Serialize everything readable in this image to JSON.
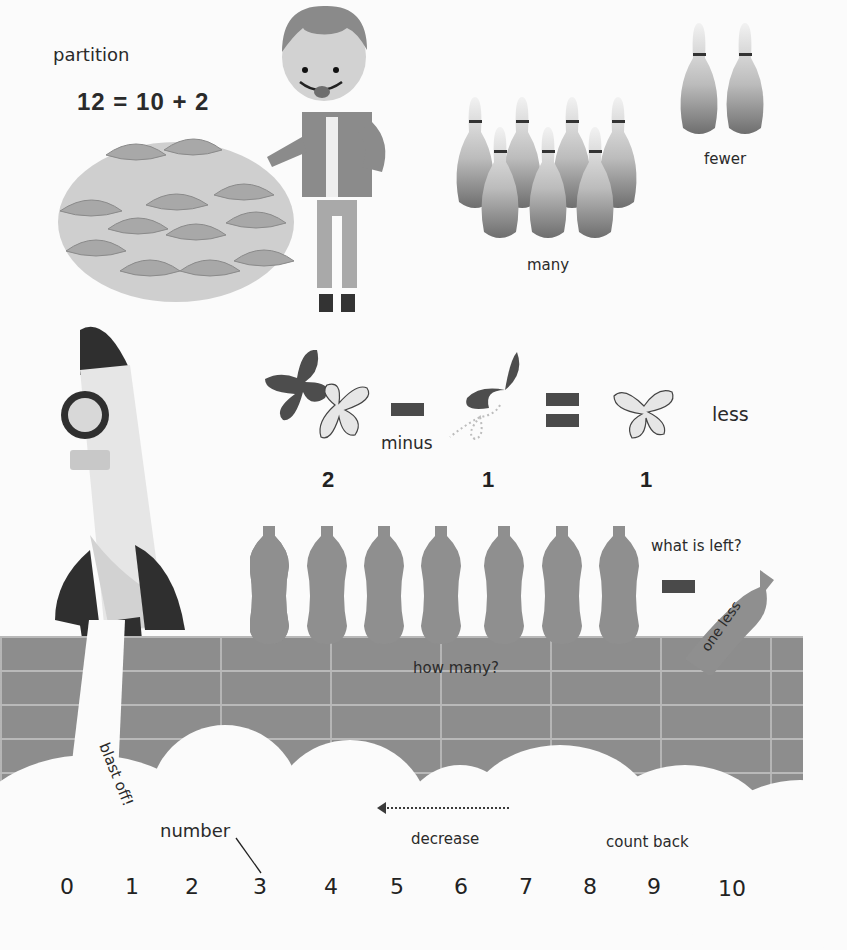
{
  "partition": {
    "title": "partition",
    "equation": "12 = 10 + 2",
    "plate_items": 12
  },
  "bowling": {
    "many_label": "many",
    "many_count": 7,
    "fewer_label": "fewer",
    "fewer_count": 2
  },
  "subtraction": {
    "minus_label": "minus",
    "less_label": "less",
    "values": [
      "2",
      "1",
      "1"
    ]
  },
  "bottles": {
    "count": 7,
    "what_is_left_label": "what is left?",
    "one_less_label": "one less",
    "how_many_label": "how many?"
  },
  "rocket": {
    "blast_off_label": "blast off!"
  },
  "number_line": {
    "number_label": "number",
    "decrease_label": "decrease",
    "count_back_label": "count back",
    "numbers": [
      "0",
      "1",
      "2",
      "3",
      "4",
      "5",
      "6",
      "7",
      "8",
      "9",
      "10"
    ]
  },
  "colors": {
    "wall": "#8d8d8d",
    "mortar": "#b9b9b9",
    "bottle": "#8f8f8f",
    "dark": "#3c3c3c",
    "plate": "#cfcfcf"
  }
}
